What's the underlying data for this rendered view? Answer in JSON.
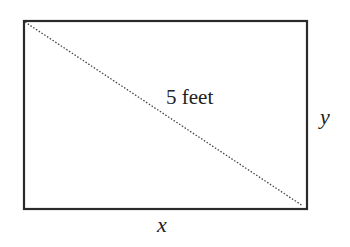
{
  "diagram": {
    "shape": "rectangle",
    "diagonal_label": "5 feet",
    "width_label": "x",
    "height_label": "y",
    "colors": {
      "stroke": "#2a2a2a",
      "diagonal": "#444444",
      "background": "#ffffff"
    }
  }
}
